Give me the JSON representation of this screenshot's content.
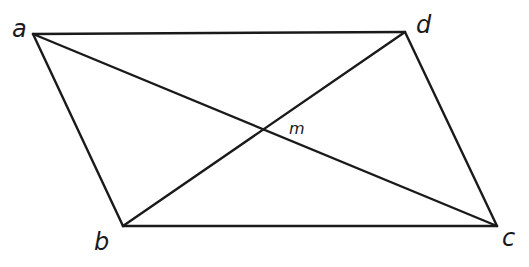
{
  "diagram": {
    "type": "parallelogram-with-diagonals",
    "vertices": {
      "a": {
        "label": "a",
        "x": 33,
        "y": 34
      },
      "b": {
        "label": "b",
        "x": 123,
        "y": 226
      },
      "c": {
        "label": "c",
        "x": 497,
        "y": 226
      },
      "d": {
        "label": "d",
        "x": 405,
        "y": 32
      }
    },
    "intersection": {
      "label": "m",
      "x": 263,
      "y": 130
    },
    "edges": [
      [
        "a",
        "d"
      ],
      [
        "d",
        "c"
      ],
      [
        "c",
        "b"
      ],
      [
        "b",
        "a"
      ]
    ],
    "diagonals": [
      [
        "a",
        "c"
      ],
      [
        "b",
        "d"
      ]
    ],
    "colors": {
      "stroke": "#1a1a1a",
      "background": "#ffffff"
    }
  }
}
